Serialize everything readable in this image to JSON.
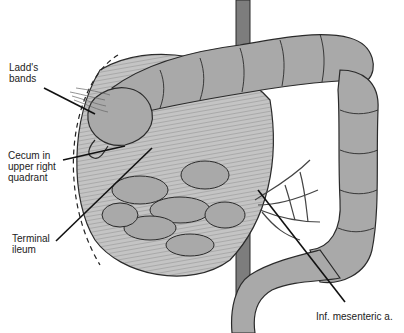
{
  "figure": {
    "colors": {
      "background": "#ffffff",
      "bowel_fill": "#a9a9a9",
      "bowel_dark": "#8c8c8c",
      "outline": "#2a2a2a",
      "leader": "#111111",
      "text": "#222222"
    },
    "labels": [
      {
        "id": "ladds-bands",
        "text": "Ladd's\nbands",
        "x": 9,
        "y": 62
      },
      {
        "id": "cecum",
        "text": "Cecum in\nupper right\nquadrant",
        "x": 8,
        "y": 150
      },
      {
        "id": "terminal-ileum",
        "text": "Terminal\nileum",
        "x": 12,
        "y": 233
      },
      {
        "id": "inf-mesenteric",
        "text": "Inf. mesenteric a.",
        "x": 316,
        "y": 311
      }
    ]
  }
}
